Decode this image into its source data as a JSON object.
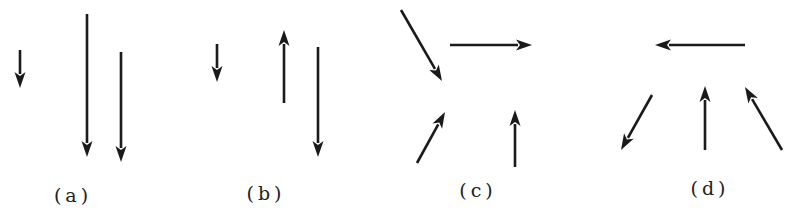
{
  "figure": {
    "panels": [
      {
        "label": "(a)",
        "label_pos": [
          73,
          195
        ],
        "arrows": [
          {
            "from": [
              20,
              50
            ],
            "to": [
              20,
              88
            ],
            "direction": "down"
          },
          {
            "from": [
              87,
              14
            ],
            "to": [
              87,
              157
            ],
            "direction": "down"
          },
          {
            "from": [
              121,
              52
            ],
            "to": [
              121,
              162
            ],
            "direction": "down"
          }
        ]
      },
      {
        "label": "(b)",
        "label_pos": [
          266,
          193
        ],
        "arrows": [
          {
            "from": [
              217,
              44
            ],
            "to": [
              217,
              82
            ],
            "direction": "down"
          },
          {
            "from": [
              284,
              103
            ],
            "to": [
              284,
              30
            ],
            "direction": "up"
          },
          {
            "from": [
              318,
              47
            ],
            "to": [
              318,
              157
            ],
            "direction": "down"
          }
        ]
      },
      {
        "label": "(c)",
        "label_pos": [
          478,
          190
        ],
        "arrows": [
          {
            "from": [
              401,
              10
            ],
            "to": [
              442,
              81
            ],
            "direction": "down-right"
          },
          {
            "from": [
              450,
              45
            ],
            "to": [
              532,
              45
            ],
            "direction": "right"
          },
          {
            "from": [
              417,
              163
            ],
            "to": [
              445,
              112
            ],
            "direction": "up-right"
          },
          {
            "from": [
              515,
              167
            ],
            "to": [
              515,
              110
            ],
            "direction": "up"
          }
        ]
      },
      {
        "label": "(d)",
        "label_pos": [
          710,
          188
        ],
        "arrows": [
          {
            "from": [
              745,
              45
            ],
            "to": [
              655,
              45
            ],
            "direction": "left"
          },
          {
            "from": [
              652,
              95
            ],
            "to": [
              621,
              150
            ],
            "direction": "down-left"
          },
          {
            "from": [
              705,
              150
            ],
            "to": [
              705,
              86
            ],
            "direction": "up"
          },
          {
            "from": [
              782,
              150
            ],
            "to": [
              745,
              87
            ],
            "direction": "up-left"
          }
        ]
      }
    ],
    "colors": {
      "arrow": "#1a1a1a",
      "background": "#ffffff"
    }
  }
}
